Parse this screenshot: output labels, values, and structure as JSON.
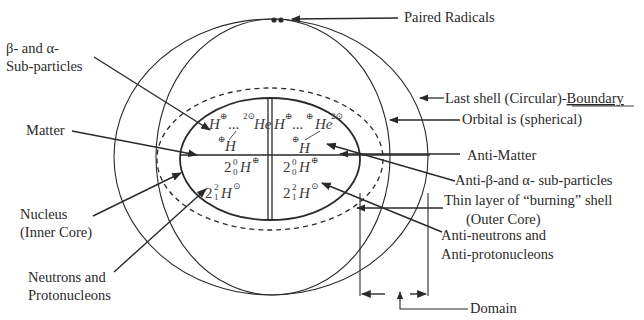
{
  "diagram": {
    "colors": {
      "ink": "#2a2a2a",
      "background": "#ffffff"
    },
    "labels": {
      "paired_radicals": "Paired Radicals",
      "beta_alpha_line1": "β- and α-",
      "beta_alpha_line2": "Sub-particles",
      "last_shell_prefix": "Last shell (Circular)-",
      "last_shell_boundary": "Boundary",
      "orbital": "Orbital is (spherical)",
      "matter": "Matter",
      "anti_matter": "Anti-Matter",
      "anti_beta_alpha": "Anti-β-and α- sub-particles",
      "thin_layer_line1": "Thin layer of “burning” shell",
      "thin_layer_line2": "(Outer Core)",
      "nucleus_line1": "Nucleus",
      "nucleus_line2": "(Inner Core)",
      "anti_neutrons_line1": "Anti-neutrons and",
      "anti_neutrons_line2": "Anti-protonucleons",
      "neutrons_line1": "Neutrons and",
      "neutrons_line2": "Protonucleons",
      "domain": "Domain"
    },
    "symbols": {
      "left_top_H": "H",
      "left_top_H_charge": "⊕",
      "left_top_dots": "...",
      "left_top_He_mass": "2⊙",
      "left_top_He": "He",
      "left_mid_H_charge": "⊕",
      "left_mid_H": "H",
      "left_n_coef": "2",
      "left_n_upper": "0",
      "left_n_lower": "0",
      "left_n_H": "H",
      "left_n_charge": "⊕",
      "left_d_coef": "2",
      "left_d_upper": "2",
      "left_d_lower": "1",
      "left_d_H": "H",
      "left_d_charge": "⊙",
      "right_top_H": "H",
      "right_top_H_charge": "⊕",
      "right_top_dots": "...",
      "right_top_He_pre": "⊕",
      "right_top_He": "He",
      "right_top_He_post": "2⊙",
      "right_mid_H_charge": "⊕",
      "right_mid_H": "H",
      "right_n_coef": "2",
      "right_n_upper": "0",
      "right_n_lower": "0",
      "right_n_H": "H",
      "right_n_charge": "⊕",
      "right_d_coef": "2",
      "right_d_upper": "2",
      "right_d_lower": "1",
      "right_d_H": "H",
      "right_d_charge": "⊙"
    }
  }
}
